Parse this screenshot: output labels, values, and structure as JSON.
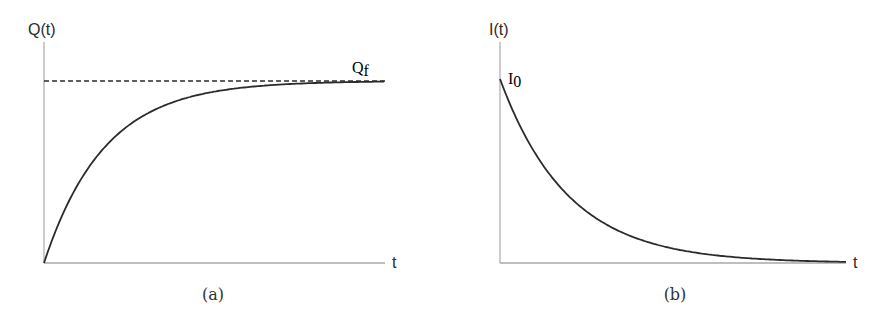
{
  "chart_data": [
    {
      "type": "line",
      "panel": "(a)",
      "title": "",
      "caption": "(a)",
      "xlabel": "t",
      "ylabel": "Q(t)",
      "grid": false,
      "legend": null,
      "function": "Q(t) = Q_f (1 - e^(-t/tau))",
      "series": [
        {
          "name": "Q(t)",
          "style": "solid",
          "x": [
            0,
            0.5,
            1,
            1.5,
            2,
            2.5,
            3,
            3.5,
            4,
            4.5,
            5,
            5.5
          ],
          "y": [
            0,
            0.39,
            0.63,
            0.78,
            0.86,
            0.92,
            0.95,
            0.97,
            0.98,
            0.99,
            0.99,
            1.0
          ]
        },
        {
          "name": "Q_f",
          "style": "dashed",
          "x": [
            0,
            5.5
          ],
          "y": [
            1,
            1
          ]
        }
      ],
      "annotations": [
        {
          "text": "Q",
          "subscript": "f",
          "position": "upper right, above dashed asymptote"
        }
      ],
      "xlim": [
        0,
        5.5
      ],
      "ylim": [
        0,
        1.0
      ]
    },
    {
      "type": "line",
      "panel": "(b)",
      "title": "",
      "caption": "(b)",
      "xlabel": "t",
      "ylabel": "I(t)",
      "grid": false,
      "legend": null,
      "function": "I(t) = I_0 e^(-t/tau)",
      "series": [
        {
          "name": "I(t)",
          "style": "solid",
          "x": [
            0,
            0.5,
            1,
            1.5,
            2,
            2.5,
            3,
            3.5,
            4,
            4.5,
            5
          ],
          "y": [
            1.0,
            0.61,
            0.37,
            0.22,
            0.14,
            0.08,
            0.05,
            0.03,
            0.02,
            0.01,
            0.01
          ]
        }
      ],
      "annotations": [
        {
          "text": "I",
          "subscript": "0",
          "position": "top of curve at t=0"
        }
      ],
      "xlim": [
        0,
        5
      ],
      "ylim": [
        0,
        1.0
      ]
    }
  ],
  "labels": {
    "a": {
      "ylabel": "Q(t)",
      "xlabel": "t",
      "asymptote_main": "Q",
      "asymptote_sub": "f",
      "caption": "(a)"
    },
    "b": {
      "ylabel": "I(t)",
      "xlabel": "t",
      "initial_main": "I",
      "initial_sub": "0",
      "caption": "(b)"
    }
  },
  "colors": {
    "axis": "#9a9a9a",
    "curve": "#2b2b2b",
    "dashed": "#2b2b2b",
    "text": "#2a2a2a"
  },
  "geometry": {
    "a": {
      "x0": 44,
      "y0": 263,
      "x1": 385,
      "ytop": 81,
      "tau_px": 60
    },
    "b": {
      "x0": 500,
      "y0": 263,
      "x1": 846,
      "ytop": 79,
      "tau_px": 68
    }
  }
}
